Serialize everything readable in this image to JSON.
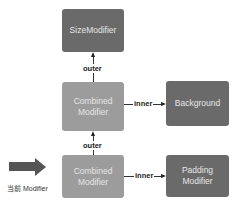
{
  "diagram": {
    "nodes": {
      "size_modifier": {
        "label": "SizeModifier"
      },
      "combined_top": {
        "line1": "Combined",
        "line2": "Modifier"
      },
      "background": {
        "label": "Background"
      },
      "combined_bottom": {
        "line1": "Combined",
        "line2": "Modifier"
      },
      "padding_modifier": {
        "line1": "Padding",
        "line2": "Modifier"
      }
    },
    "edges": {
      "outer_top": "outer",
      "inner_top": "inner",
      "outer_bottom": "outer",
      "inner_bottom": "inner"
    },
    "pointer_label": "当前 Modifier",
    "colors": {
      "dark_box": "#6a6a6a",
      "light_box": "#9c9c9c",
      "box_text": "#e6e6e6",
      "connector": "#333333",
      "pointer_arrow": "#555555"
    }
  }
}
